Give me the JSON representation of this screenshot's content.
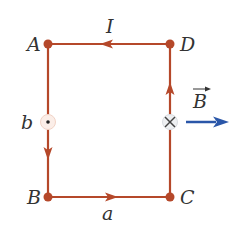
{
  "diagram": {
    "colors": {
      "wire": "#b5482a",
      "field_arrow": "#2a56a8",
      "text": "#333333"
    },
    "vertices": [
      {
        "label": "A",
        "x": 48,
        "y": 44
      },
      {
        "label": "D",
        "x": 170,
        "y": 44
      },
      {
        "label": "B",
        "x": 48,
        "y": 197
      },
      {
        "label": "C",
        "x": 170,
        "y": 197
      }
    ],
    "labels": {
      "current": "I",
      "side_b": "b",
      "side_a": "a",
      "field": "B",
      "A": "A",
      "B": "B",
      "C": "C",
      "D": "D"
    },
    "symbols": {
      "out_of_page": "dot",
      "into_page": "cross"
    },
    "current_direction": [
      "D→A",
      "A→B",
      "B→C",
      "C→D"
    ]
  }
}
